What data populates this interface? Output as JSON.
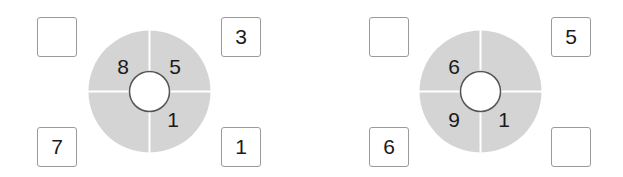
{
  "puzzles": [
    {
      "boxes": {
        "top_left": "",
        "top_right": "3",
        "bottom_left": "7",
        "bottom_right": "1"
      },
      "wheel": {
        "top_left": "8",
        "top_right": "5",
        "bottom_left": "",
        "bottom_right": "1"
      }
    },
    {
      "boxes": {
        "top_left": "",
        "top_right": "5",
        "bottom_left": "6",
        "bottom_right": ""
      },
      "wheel": {
        "top_left": "6",
        "top_right": "",
        "bottom_left": "9",
        "bottom_right": "1"
      }
    }
  ],
  "colors": {
    "wheel_fill": "#d4d4d4",
    "divider": "#ffffff",
    "box_border": "#9a9a9a",
    "hub_border": "#555555"
  }
}
